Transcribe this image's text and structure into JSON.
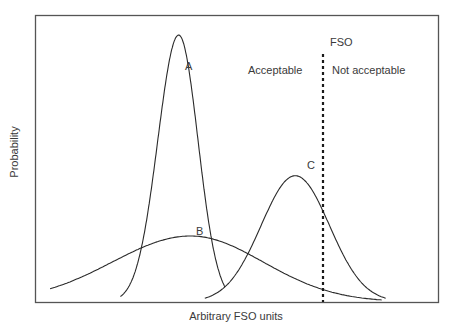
{
  "chart_data": {
    "type": "line",
    "title": "",
    "xlabel": "Arbitrary FSO units",
    "ylabel": "Probability",
    "grid": false,
    "legend": null,
    "xlim": [
      0,
      100
    ],
    "ylim": [
      0,
      1
    ],
    "x_ticks": [],
    "y_ticks": [],
    "series": [
      {
        "name": "A",
        "kind": "narrow distribution",
        "mean": 35.5,
        "sd_left": 5.2,
        "sd_right": 4.8,
        "peak": 0.93,
        "label_pos": [
          38,
          0.98
        ]
      },
      {
        "name": "B",
        "kind": "wide distribution",
        "mean": 38.5,
        "sd_left": 19.5,
        "sd_right": 18,
        "peak": 0.23,
        "label_pos": [
          41,
          0.27
        ]
      },
      {
        "name": "C",
        "kind": "distribution near FSO",
        "mean": 64.5,
        "sd_left": 8.5,
        "sd_right": 8.5,
        "peak": 0.44,
        "label_pos": [
          68.5,
          0.51
        ]
      }
    ],
    "annotations": [
      {
        "text": "FSO",
        "type": "vertical-dashed-line",
        "x": 71.5
      },
      {
        "text": "Acceptable",
        "region": "left of FSO"
      },
      {
        "text": "Not acceptable",
        "region": "right of FSO"
      }
    ]
  },
  "labels": {
    "xlabel": "Arbitrary FSO units",
    "ylabel": "Probability",
    "fso": "FSO",
    "acceptable": "Acceptable",
    "not_acceptable": "Not acceptable",
    "curve_a": "A",
    "curve_b": "B",
    "curve_c": "C"
  },
  "colors": {
    "axis": "#555555",
    "curve": "#2a2a2a",
    "fso_line": "#1a1a1a",
    "text": "#3a3a3a"
  }
}
